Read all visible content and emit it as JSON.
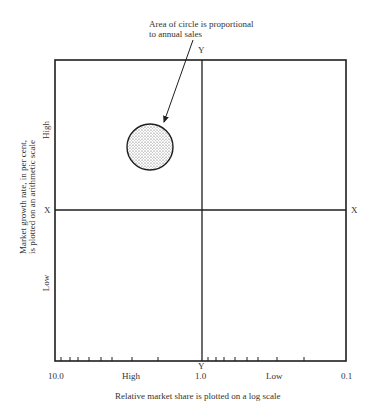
{
  "annotation": {
    "line1": "Area of circle is proportional",
    "line2": "to annual sales"
  },
  "axes": {
    "y_axis_title_line1": "Market growth rate, in per cent,",
    "y_axis_title_line2": "is plotted on an arithmetic scale",
    "x_axis_title": "Relative market share is plotted on a log scale",
    "y_high": "High",
    "y_low": "Low",
    "x_high": "High",
    "x_low": "Low",
    "x_tick_left": "10.0",
    "x_tick_mid": "1.0",
    "x_tick_right": "0.1",
    "x_line_label_left": "X",
    "x_line_label_right": "X",
    "y_line_label_top": "Y",
    "y_line_label_bottom": "Y"
  },
  "circle": {
    "description": "Stippled circle representing a business unit",
    "quadrant": "high growth, high share"
  },
  "colors": {
    "line": "#1e1e1e",
    "circle_fill": "#d9d9d9"
  }
}
